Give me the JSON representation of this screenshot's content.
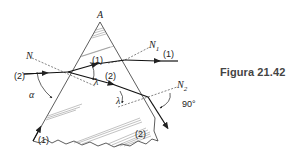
{
  "figure": {
    "caption": "Figura 21.42",
    "labels": {
      "apex": "A",
      "normal_entry": "N",
      "normal_exit_1": "N",
      "normal_exit_1_sub": "1",
      "normal_exit_2": "N",
      "normal_exit_2_sub": "2",
      "ray1_inside": "(1)",
      "ray1_exit": "(1)",
      "ray1_bottom": "(1)",
      "ray2_incident": "(2)",
      "ray2_inside": "(2)",
      "ray2_exit": "(2)",
      "angle_alpha": "α",
      "angle_lambda_1": "λ",
      "angle_lambda_2": "λ",
      "angle_right": "90°"
    },
    "colors": {
      "line": "#222222",
      "caption": "#444444"
    }
  }
}
